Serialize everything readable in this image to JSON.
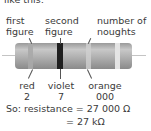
{
  "intro_text": "like this:",
  "labels_top": {
    "first": [
      "first",
      "figure"
    ],
    "second": [
      "second",
      "figure"
    ],
    "third": [
      "number of",
      "noughts"
    ]
  },
  "bands": [
    {
      "name": "red",
      "digit": "2",
      "color": "#a9a9a9"
    },
    {
      "name": "violet",
      "digit": "7",
      "color": "#1f1f1f"
    },
    {
      "name": "orange",
      "digit": "000",
      "color": "#cfcfcf"
    },
    {
      "name": "tolerance",
      "digit": "",
      "color": "#dedede"
    }
  ],
  "result": {
    "line1": "So: resistance = 27 000 Ω",
    "line2": "= 27 kΩ"
  }
}
